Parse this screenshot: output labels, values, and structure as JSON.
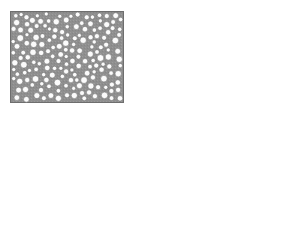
{
  "figure": {
    "title": "",
    "background_color": "#ffffff",
    "panel_count": 3,
    "layout": "2x2 grid with top-left, top-right and bottom-right cells occupied; bottom-left cell empty"
  },
  "palette": {
    "background": "#ffffff",
    "matrix_gray": "#8f8f8f",
    "matrix_gray_dark": "#7a7a7a",
    "matrix_gray_light": "#a8a8a8",
    "pore_white": "#fbfbfb",
    "outline_gray": "#6e6e6e",
    "speckle_gray": "#b5b5b5"
  },
  "panels": [
    {
      "id": "panel-a",
      "name": "circular-pore-microstructure",
      "position": "top-left",
      "label": "",
      "x": 10,
      "y": 11,
      "width": 114,
      "height": 92,
      "pattern": "droplet",
      "description": "Dense disordered packing of white circular pores in a uniform gray matrix, flat rectangular boundary on all four sides",
      "matrix_color": "#8f8f8f",
      "pore_color": "#fbfbfb",
      "pore_outline": "#6e6e6e",
      "top_profile": "flat",
      "approx_pore_count": 170,
      "pore_radius_range_px": [
        2.0,
        3.4
      ]
    },
    {
      "id": "panel-b",
      "name": "labyrinthine-spinodal-microstructure",
      "position": "top-right",
      "label": "",
      "x": 155,
      "y": 13,
      "width": 115,
      "height": 90,
      "pattern": "labyrinth",
      "description": "Interconnected worm-like gray channels forming a bicontinuous labyrinth on a white background, with a few isolated white circular pores embedded in the gray network",
      "matrix_color": "#ffffff",
      "channel_color": "#8f8f8f",
      "channel_outline": "#6e6e6e",
      "top_profile": "flat",
      "approx_channel_width_px": 4.5,
      "isolated_pore_count": 7
    },
    {
      "id": "panel-c",
      "name": "notched-circular-pore-microstructure",
      "position": "bottom-right",
      "label": "",
      "x": 155,
      "y": 123,
      "width": 115,
      "height": 93,
      "pattern": "droplet",
      "description": "Same dense packing of white circular pores in a gray matrix, but the top edge is eroded into a wide smooth concave notch that is deepest at the centre",
      "matrix_color": "#8f8f8f",
      "pore_color": "#fbfbfb",
      "pore_outline": "#6e6e6e",
      "top_profile": "concave-notch",
      "notch": {
        "left_shoulder_x_frac": 0.13,
        "right_shoulder_x_frac": 0.84,
        "max_depth_px": 19,
        "deepest_x_frac": 0.5
      },
      "approx_pore_count": 175,
      "pore_radius_range_px": [
        2.0,
        3.4
      ]
    }
  ],
  "chart_data": {
    "type": "heatmap",
    "title": "",
    "xlabel": "",
    "ylabel": "",
    "panels": [
      "droplet morphology",
      "labyrinth morphology",
      "droplet morphology with concave surface notch"
    ]
  }
}
